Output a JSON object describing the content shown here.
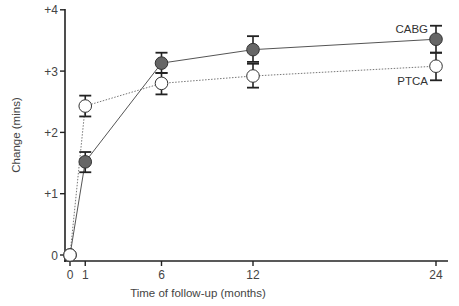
{
  "chart_data": {
    "type": "line",
    "title": "",
    "xlabel": "Time of follow-up (months)",
    "ylabel": "Change (mins)",
    "x": [
      0,
      1,
      6,
      12,
      24
    ],
    "x_ticks": [
      "0",
      "1",
      "6",
      "12",
      "24"
    ],
    "y_ticks": [
      "0",
      "+1",
      "+2",
      "+3",
      "+4"
    ],
    "xlim": [
      0,
      24
    ],
    "ylim": [
      0,
      4
    ],
    "grid": false,
    "legend_position": "inline labels at right end of series",
    "series": [
      {
        "name": "CABG",
        "marker": "filled-circle",
        "line_style": "solid",
        "color": "#666666",
        "values": [
          0,
          1.52,
          3.13,
          3.35,
          3.52
        ],
        "error_low": [
          0,
          1.35,
          2.97,
          3.15,
          3.3
        ],
        "error_high": [
          0,
          1.68,
          3.3,
          3.57,
          3.74
        ]
      },
      {
        "name": "PTCA",
        "marker": "open-circle",
        "line_style": "dotted",
        "color": "#ffffff",
        "values": [
          0,
          2.43,
          2.8,
          2.92,
          3.08
        ],
        "error_low": [
          0,
          2.26,
          2.62,
          2.73,
          2.85
        ],
        "error_high": [
          0,
          2.6,
          2.97,
          3.12,
          3.3
        ]
      }
    ]
  }
}
